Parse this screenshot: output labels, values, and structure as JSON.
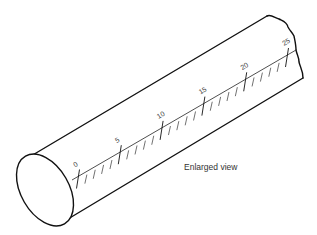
{
  "figure": {
    "caption": "Enlarged view",
    "scale": {
      "min": 0,
      "max": 25,
      "major_step": 5,
      "minor_step": 1,
      "labels": [
        "0",
        "5",
        "10",
        "15",
        "20",
        "25"
      ]
    }
  }
}
